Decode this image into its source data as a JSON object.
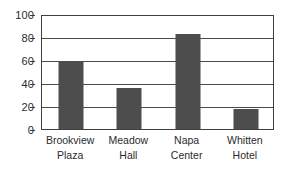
{
  "chart_data": {
    "type": "bar",
    "title": "",
    "xlabel": "",
    "ylabel": "",
    "categories": [
      "Brookview Plaza",
      "Meadow Hall",
      "Napa Center",
      "Whitten Hotel"
    ],
    "category_lines": [
      [
        "Brookview",
        "Plaza"
      ],
      [
        "Meadow",
        "Hall"
      ],
      [
        "Napa",
        "Center"
      ],
      [
        "Whitten",
        "Hotel"
      ]
    ],
    "values": [
      60,
      36,
      84,
      18
    ],
    "ylim": [
      0,
      100
    ],
    "yticks": [
      0,
      20,
      40,
      60,
      80,
      100
    ],
    "ytick_labels": [
      "0",
      "20",
      "40",
      "60",
      "80",
      "100"
    ],
    "grid": true,
    "grid_axis": "y",
    "legend": null,
    "bar_color": "#4d4d4d",
    "grid_color": "#4a4a4a",
    "frame_color": "#3f3f3f",
    "background_color": "#ffffff",
    "text_color": "#2b2b2b"
  }
}
